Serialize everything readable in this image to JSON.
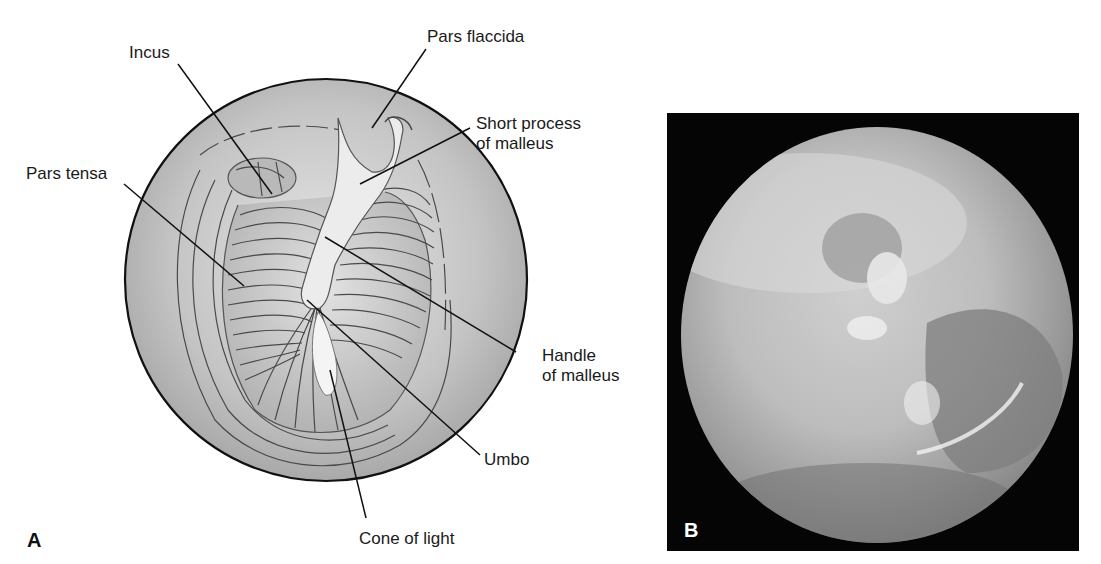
{
  "figure": {
    "panel_a": {
      "letter": "A",
      "description": "Illustration of normal right tympanic membrane",
      "labels": {
        "incus": "Incus",
        "pars_flaccida": "Pars flaccida",
        "short_process_line1": "Short process",
        "short_process_line2": "of malleus",
        "pars_tensa": "Pars tensa",
        "handle_line1": "Handle",
        "handle_line2": "of malleus",
        "umbo": "Umbo",
        "cone_of_light": "Cone of light"
      }
    },
    "panel_b": {
      "letter": "B",
      "description": "Otoscopic photograph of tympanic membrane"
    },
    "colors": {
      "membrane_fill": "#bdbdbd",
      "outline": "#111111",
      "photo_background": "#050505"
    }
  }
}
